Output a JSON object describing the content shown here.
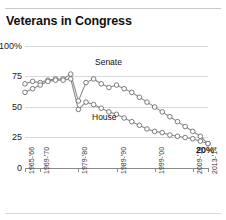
{
  "header": {
    "title": "Veterans in Congress"
  },
  "annotations": {
    "senate_label": "Senate",
    "house_label": "House",
    "end_value_label": "20%"
  },
  "axis": {
    "y_ticks": [
      "100%",
      "75",
      "50",
      "25",
      "0"
    ],
    "x_ticks": [
      "1965-'66",
      "1969-'70",
      "1979-'80",
      "1989-'90",
      "1999-'00",
      "2009-'10",
      "2013-'14"
    ]
  },
  "chart_data": {
    "type": "line",
    "title": "Veterans in Congress",
    "xlabel": "",
    "ylabel": "",
    "ylim": [
      0,
      100
    ],
    "ytick_values": [
      0,
      25,
      50,
      75,
      100
    ],
    "ytick_labels": [
      "0",
      "25",
      "50",
      "75",
      "100%"
    ],
    "grid": true,
    "legend": "inline-labels",
    "x": [
      "1965-'66",
      "1967-'68",
      "1969-'70",
      "1971-'72",
      "1973-'74",
      "1975-'76",
      "1977-'78",
      "1979-'80",
      "1981-'82",
      "1983-'84",
      "1985-'86",
      "1987-'88",
      "1989-'90",
      "1991-'92",
      "1993-'94",
      "1995-'96",
      "1997-'98",
      "1999-'00",
      "2001-'02",
      "2003-'04",
      "2005-'06",
      "2007-'08",
      "2009-'10",
      "2011-'12",
      "2013-'14"
    ],
    "x_tick_labels_shown": [
      "1965-'66",
      "1969-'70",
      "1979-'80",
      "1989-'90",
      "1999-'00",
      "2009-'10",
      "2013-'14"
    ],
    "series": [
      {
        "name": "Senate",
        "values": [
          69,
          71,
          70,
          72,
          73,
          73,
          77,
          55,
          70,
          73,
          69,
          66,
          68,
          65,
          62,
          58,
          54,
          50,
          46,
          42,
          38,
          34,
          30,
          26,
          20
        ]
      },
      {
        "name": "House",
        "values": [
          62,
          65,
          68,
          71,
          72,
          72,
          73,
          48,
          54,
          52,
          49,
          46,
          44,
          41,
          38,
          35,
          32,
          30,
          29,
          27,
          26,
          25,
          24,
          22,
          20
        ]
      }
    ],
    "annotations": [
      {
        "text": "Senate",
        "series": "Senate"
      },
      {
        "text": "House",
        "series": "House"
      },
      {
        "text": "20%",
        "note": "final value both series"
      }
    ]
  },
  "colors": {
    "line": "#8c8c8c",
    "marker_fill": "#ffffff",
    "marker_stroke": "#6e6e6e",
    "grid": "#d8d8d8",
    "axis": "#8a8a8a",
    "text": "#111111"
  }
}
